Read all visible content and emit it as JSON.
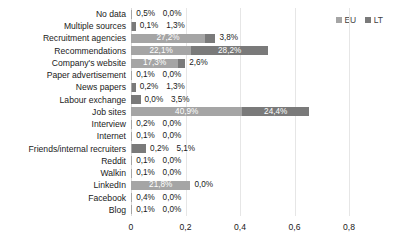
{
  "chart_data": {
    "type": "bar",
    "orientation": "horizontal",
    "stacked": true,
    "title": "",
    "xlabel": "",
    "ylabel": "",
    "xlim": [
      0,
      0.8
    ],
    "grid": true,
    "legend_position": "top-right",
    "legend": [
      "EU",
      "LT"
    ],
    "xticks": [
      "0",
      "0,2",
      "0,4",
      "0,6",
      "0,8"
    ],
    "xtick_values": [
      0,
      0.2,
      0.4,
      0.6,
      0.8
    ],
    "categories": [
      "No data",
      "Multiple sources",
      "Recruitment agencies",
      "Recommendations",
      "Company's website",
      "Paper advertisement",
      "News papers",
      "Labour exchange",
      "Job sites",
      "Interview",
      "Internet",
      "Friends/internal recruiters",
      "Reddit",
      "Walkin",
      "LinkedIn",
      "Facebook",
      "Blog"
    ],
    "series": [
      {
        "name": "EU",
        "color": "#a5a5a5",
        "values": [
          0.005,
          0.001,
          0.272,
          0.221,
          0.173,
          0.001,
          0.002,
          0.0,
          0.409,
          0.002,
          0.001,
          0.002,
          0.001,
          0.001,
          0.218,
          0.004,
          0.001
        ],
        "labels": [
          "0,5%",
          "0,1%",
          "27,2%",
          "22,1%",
          "17,3%",
          "0,1%",
          "0,2%",
          "0,0%",
          "40,9%",
          "0,2%",
          "0,1%",
          "0,2%",
          "0,1%",
          "0,1%",
          "21,8%",
          "0,4%",
          "0,1%"
        ]
      },
      {
        "name": "LT",
        "color": "#7a7a7a",
        "values": [
          0.0,
          0.013,
          0.038,
          0.282,
          0.026,
          0.0,
          0.013,
          0.035,
          0.244,
          0.0,
          0.0,
          0.051,
          0.0,
          0.0,
          0.0,
          0.0,
          0.0
        ],
        "labels": [
          "0,0%",
          "1,3%",
          "3,8%",
          "28,2%",
          "2,6%",
          "0,0%",
          "1,3%",
          "3,5%",
          "24,4%",
          "0,0%",
          "0,0%",
          "5,1%",
          "0,0%",
          "0,0%",
          "0,0%",
          "0,0%",
          "0,0%"
        ]
      }
    ]
  }
}
